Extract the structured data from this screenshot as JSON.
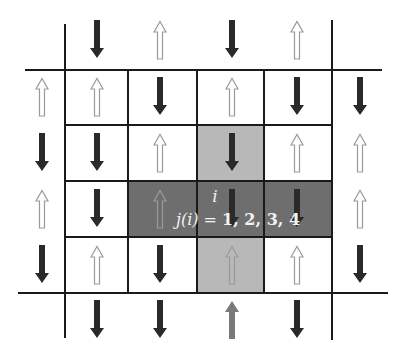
{
  "diagram": {
    "type": "square-lattice spin configuration",
    "colors": {
      "line": "#1a1a1a",
      "spin_down_fill": "#2a2a2a",
      "spin_up_outline": "#9a9a9a",
      "site_i_fill": "#6e6e6e",
      "neighbor_fill": "#b8b8b8",
      "highlighted_row_fill": "#6e6e6e",
      "boundary_up_arrow": "#7a7a7a"
    },
    "columns_x": [
      42,
      97,
      160,
      232,
      297,
      360
    ],
    "rows_y": [
      40,
      97,
      153,
      209,
      265,
      320
    ],
    "spins": [
      {
        "row": 0,
        "col": 1,
        "dir": "down"
      },
      {
        "row": 0,
        "col": 2,
        "dir": "up"
      },
      {
        "row": 0,
        "col": 3,
        "dir": "down"
      },
      {
        "row": 0,
        "col": 4,
        "dir": "up"
      },
      {
        "row": 1,
        "col": 0,
        "dir": "up"
      },
      {
        "row": 1,
        "col": 1,
        "dir": "up"
      },
      {
        "row": 1,
        "col": 2,
        "dir": "down"
      },
      {
        "row": 1,
        "col": 3,
        "dir": "up"
      },
      {
        "row": 1,
        "col": 4,
        "dir": "down"
      },
      {
        "row": 1,
        "col": 5,
        "dir": "down"
      },
      {
        "row": 2,
        "col": 0,
        "dir": "down"
      },
      {
        "row": 2,
        "col": 1,
        "dir": "down"
      },
      {
        "row": 2,
        "col": 2,
        "dir": "up"
      },
      {
        "row": 2,
        "col": 3,
        "dir": "down"
      },
      {
        "row": 2,
        "col": 4,
        "dir": "up"
      },
      {
        "row": 2,
        "col": 5,
        "dir": "up"
      },
      {
        "row": 3,
        "col": 0,
        "dir": "up"
      },
      {
        "row": 3,
        "col": 1,
        "dir": "down"
      },
      {
        "row": 3,
        "col": 2,
        "dir": "up"
      },
      {
        "row": 3,
        "col": 3,
        "dir": "down"
      },
      {
        "row": 3,
        "col": 4,
        "dir": "down"
      },
      {
        "row": 3,
        "col": 5,
        "dir": "up"
      },
      {
        "row": 4,
        "col": 0,
        "dir": "down"
      },
      {
        "row": 4,
        "col": 1,
        "dir": "up"
      },
      {
        "row": 4,
        "col": 2,
        "dir": "down"
      },
      {
        "row": 4,
        "col": 3,
        "dir": "up"
      },
      {
        "row": 4,
        "col": 4,
        "dir": "up"
      },
      {
        "row": 4,
        "col": 5,
        "dir": "down"
      },
      {
        "row": 5,
        "col": 1,
        "dir": "down"
      },
      {
        "row": 5,
        "col": 2,
        "dir": "down"
      },
      {
        "row": 5,
        "col": 3,
        "dir": "up-gray"
      },
      {
        "row": 5,
        "col": 4,
        "dir": "down"
      }
    ],
    "labels": {
      "site": "i",
      "neighbors_prefix": "j(i) = ",
      "neighbors_values": "1, 2, 3, 4"
    }
  }
}
